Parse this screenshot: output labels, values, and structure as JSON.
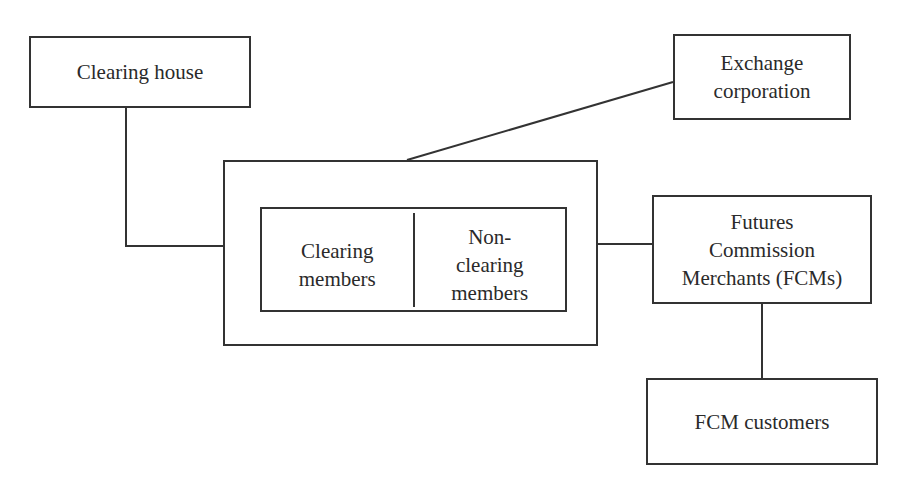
{
  "diagram": {
    "type": "organizational structure",
    "stroke_color": "#333333",
    "nodes": {
      "clearing_house": {
        "label": "Clearing house"
      },
      "exchange_corporation": {
        "label": "Exchange\ncorporation"
      },
      "exchange_members": {
        "clearing_members": {
          "label": "Clearing\nmembers"
        },
        "non_clearing_members": {
          "label": "Non-\nclearing\nmembers"
        }
      },
      "fcms": {
        "label": "Futures\nCommission\nMerchants (FCMs)"
      },
      "fcm_customers": {
        "label": "FCM customers"
      }
    },
    "edges": [
      {
        "from": "clearing_house",
        "to": "exchange_members"
      },
      {
        "from": "exchange_corporation",
        "to": "exchange_members"
      },
      {
        "from": "exchange_members",
        "to": "fcms"
      },
      {
        "from": "fcms",
        "to": "fcm_customers"
      }
    ]
  }
}
